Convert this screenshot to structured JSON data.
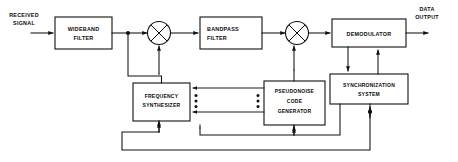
{
  "diagram": {
    "type": "block-diagram",
    "line_color": "#111111",
    "background_color": "#ffffff",
    "text_color": "#0b0b0b",
    "inputs": [
      {
        "id": "received-signal",
        "label_line1": "RECEIVED",
        "label_line2": "SIGNAL"
      }
    ],
    "outputs": [
      {
        "id": "data-output",
        "label_line1": "DATA",
        "label_line2": "OUTPUT"
      }
    ],
    "blocks": [
      {
        "id": "wideband-filter",
        "label_line1": "WIDEBAND",
        "label_line2": "FILTER",
        "align": "center"
      },
      {
        "id": "bandpass-filter",
        "label_line1": "BANDPASS",
        "label_line2": "FILTER",
        "align": "left"
      },
      {
        "id": "demodulator",
        "label_line1": "DEMODULATOR",
        "label_line2": "",
        "align": "center"
      },
      {
        "id": "frequency-synthesizer",
        "label_line1": "FREQUENCY",
        "label_line2": "SYNTHESIZER",
        "align": "center"
      },
      {
        "id": "pseudonoise-code-generator",
        "label_line1": "PSEUDONOISE",
        "label_line2": "CODE",
        "label_line3": "GENERATOR",
        "align": "center"
      },
      {
        "id": "synchronization-system",
        "label_line1": "SYNCHRONIZATION",
        "label_line2": "SYSTEM",
        "align": "center"
      }
    ],
    "mixers": [
      {
        "id": "mixer-1",
        "symbol": "circle-x"
      },
      {
        "id": "mixer-2",
        "symbol": "circle-x"
      }
    ],
    "bus_connections": {
      "from": "pseudonoise-code-generator",
      "to": "frequency-synthesizer",
      "count": 3,
      "style": "arrow-with-dot-markers"
    }
  }
}
